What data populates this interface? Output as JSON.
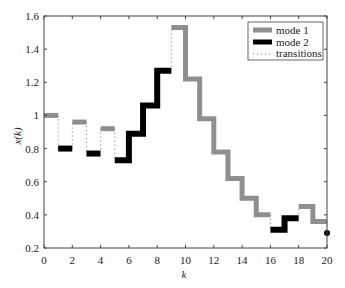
{
  "chart_data": {
    "type": "line",
    "subtype": "stairs",
    "title": "",
    "xlabel": "k",
    "ylabel": "x(k)",
    "xlim": [
      0,
      20
    ],
    "ylim": [
      0.2,
      1.6
    ],
    "xticks": [
      0,
      2,
      4,
      6,
      8,
      10,
      12,
      14,
      16,
      18,
      20
    ],
    "yticks": [
      0.2,
      0.4,
      0.6,
      0.8,
      1.0,
      1.2,
      1.4,
      1.6
    ],
    "xtick_labels": [
      "0",
      "2",
      "4",
      "6",
      "8",
      "10",
      "12",
      "14",
      "16",
      "18",
      "20"
    ],
    "ytick_labels": [
      "0.2",
      "0.4",
      "0.6",
      "0.8",
      "1",
      "1.2",
      "1.4",
      "1.6"
    ],
    "grid": false,
    "legend_position": "upper right",
    "legend": [
      {
        "label": "mode 1",
        "style": "thick-gray"
      },
      {
        "label": "mode 2",
        "style": "thick-black"
      },
      {
        "label": "transitions",
        "style": "dotted"
      }
    ],
    "colors": {
      "mode1": "#8f8f8f",
      "mode2": "#000000",
      "transitions": "#777777",
      "axes": "#444444"
    },
    "x": [
      0,
      1,
      2,
      3,
      4,
      5,
      6,
      7,
      8,
      9,
      10,
      11,
      12,
      13,
      14,
      15,
      16,
      17,
      18,
      19,
      20
    ],
    "values": [
      1.0,
      0.8,
      0.96,
      0.77,
      0.92,
      0.73,
      0.89,
      1.06,
      1.27,
      1.53,
      1.22,
      0.98,
      0.78,
      0.62,
      0.5,
      0.4,
      0.31,
      0.38,
      0.45,
      0.36,
      0.29
    ],
    "modes": [
      1,
      2,
      1,
      2,
      1,
      2,
      2,
      2,
      2,
      1,
      1,
      1,
      1,
      1,
      1,
      1,
      2,
      2,
      1,
      1,
      2
    ],
    "series": [
      {
        "name": "mode 1",
        "x": [
          0,
          2,
          4,
          9,
          10,
          11,
          12,
          13,
          14,
          15,
          18,
          19
        ],
        "values": [
          1.0,
          0.96,
          0.92,
          1.53,
          1.22,
          0.98,
          0.78,
          0.62,
          0.5,
          0.4,
          0.45,
          0.36
        ]
      },
      {
        "name": "mode 2",
        "x": [
          1,
          3,
          5,
          6,
          7,
          8,
          16,
          17,
          20
        ],
        "values": [
          0.8,
          0.77,
          0.73,
          0.89,
          1.06,
          1.27,
          0.31,
          0.38,
          0.29
        ]
      }
    ]
  }
}
